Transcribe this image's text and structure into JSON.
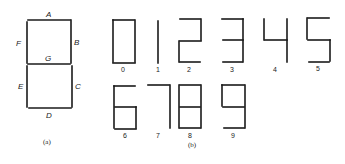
{
  "figure": {
    "panel_a": {
      "caption": "(a)",
      "segment_labels": {
        "A": "A",
        "B": "B",
        "C": "C",
        "D": "D",
        "E": "E",
        "F": "F",
        "G": "G"
      }
    },
    "panel_b": {
      "caption": "(b)",
      "digits": [
        {
          "label": "0",
          "segments": "ABCDEF"
        },
        {
          "label": "1",
          "segments": "BC"
        },
        {
          "label": "2",
          "segments": "ABGED"
        },
        {
          "label": "3",
          "segments": "ABGCD"
        },
        {
          "label": "4",
          "segments": "FGBC"
        },
        {
          "label": "5",
          "segments": "AFGCD"
        },
        {
          "label": "6",
          "segments": "AFGECD"
        },
        {
          "label": "7",
          "segments": "ABC"
        },
        {
          "label": "8",
          "segments": "ABCDEFG"
        },
        {
          "label": "9",
          "segments": "ABCDFG"
        }
      ]
    }
  }
}
